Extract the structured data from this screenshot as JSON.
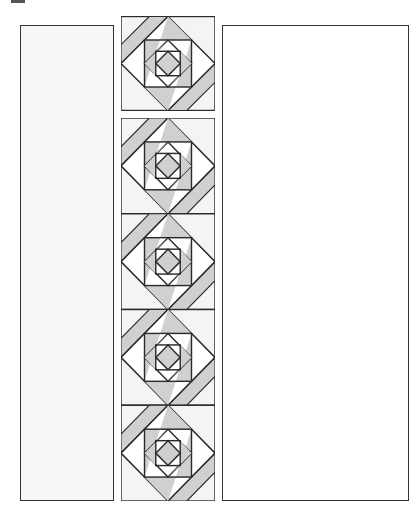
{
  "diagram": {
    "type": "quilt-layout",
    "colors": {
      "light": "#f4f4f4",
      "shade": "#d0d0d0",
      "line": "#2a2a2a",
      "white": "#ffffff"
    },
    "left_panel": {
      "label": ""
    },
    "right_panel": {
      "label": ""
    },
    "center_column": {
      "top_block_count": 1,
      "strip_block_count": 4
    }
  }
}
